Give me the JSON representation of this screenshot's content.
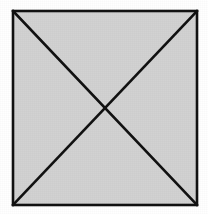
{
  "figure": {
    "name": "square-with-both-diagonals",
    "canvas": {
      "width": 208,
      "height": 214,
      "background_color": "#ffffff"
    },
    "square": {
      "label": "",
      "fill_color": "#d2d2d2",
      "stroke_color": "#111111",
      "stroke_width": 2.6,
      "left": 13,
      "top": 11,
      "right": 197,
      "bottom": 205,
      "width": 184,
      "height": 194,
      "corners": {
        "top_left": [
          13,
          11
        ],
        "top_right": [
          197,
          11
        ],
        "bottom_right": [
          197,
          205
        ],
        "bottom_left": [
          13,
          205
        ]
      }
    },
    "diagonals": {
      "stroke_color": "#111111",
      "stroke_width": 2.6,
      "intersection_point": [
        105,
        108
      ],
      "lines": [
        {
          "name": "diagonal-top-left-to-bottom-right",
          "from": [
            13,
            11
          ],
          "to": [
            197,
            205
          ]
        },
        {
          "name": "diagonal-top-right-to-bottom-left",
          "from": [
            197,
            11
          ],
          "to": [
            13,
            205
          ]
        }
      ]
    },
    "texture": {
      "style": "scanned-paper-grain",
      "enabled": true
    },
    "annotations": [],
    "text_labels": []
  }
}
